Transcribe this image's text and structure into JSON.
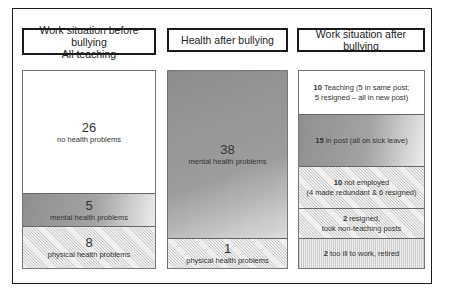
{
  "columns": [
    {
      "header_lines": [
        "Work situation before bullying",
        "All teaching"
      ],
      "cells": [
        {
          "count": "26",
          "label": "no health problems",
          "style": "white"
        },
        {
          "count": "5",
          "label": "mental health problems",
          "style": "gradient"
        },
        {
          "count": "8",
          "label": "physical health problems",
          "style": "hatched"
        }
      ]
    },
    {
      "header_lines": [
        "Health after bullying"
      ],
      "cells": [
        {
          "count": "38",
          "label": "mental health problems",
          "style": "gradient"
        },
        {
          "count": "1",
          "label": "physical health problems",
          "style": "hatched"
        }
      ]
    },
    {
      "header_lines": [
        "Work situation after bullying"
      ],
      "cells": [
        {
          "count": "10",
          "line1": "Teaching (5 in same post;",
          "line2": "5 resigned – all in new post)",
          "style": "white"
        },
        {
          "count": "15",
          "line1": "in post (all on sick leave)",
          "style": "gradient"
        },
        {
          "count": "10",
          "line1": "not employed",
          "line2": "(4 made redundant & 6 resigned)",
          "style": "hatched"
        },
        {
          "count": "2",
          "line1": "resigned,",
          "line2": "took non-teaching posts",
          "style": "hatched"
        },
        {
          "count": "2",
          "line1": "too ill to work, retired",
          "style": "vertical-lines"
        }
      ]
    }
  ],
  "colors": {
    "border": "#1a1a1a",
    "gradient_dark": "#8f8f8f",
    "gradient_light": "#ececec",
    "hatch_bg": "#efefef"
  }
}
